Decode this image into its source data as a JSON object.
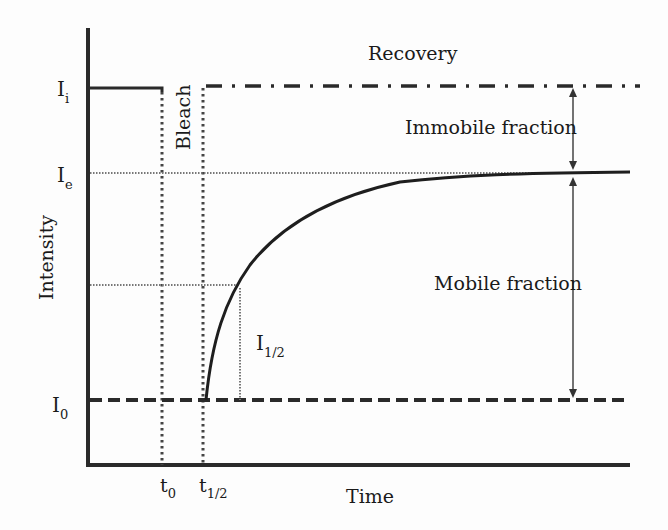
{
  "figure": {
    "type": "FRAP recovery curve diagram",
    "axes": {
      "xlabel": "Time",
      "ylabel": "Intensity",
      "x_ticks": [
        {
          "base": "t",
          "sub": "0"
        },
        {
          "base": "t",
          "sub": "1/2"
        }
      ],
      "y_ticks": [
        {
          "base": "I",
          "sub": "i"
        },
        {
          "base": "I",
          "sub": "e"
        },
        {
          "base": "I",
          "sub": "0"
        }
      ]
    },
    "labels": {
      "bleach": "Bleach",
      "recovery": "Recovery",
      "immobile_fraction": "Immobile fraction",
      "mobile_fraction": "Mobile fraction",
      "half_intensity": {
        "base": "I",
        "sub": "1/2"
      }
    },
    "colors": {
      "line": "#2a2a2a",
      "dotted": "#555555",
      "background": "#fdfdfd"
    }
  }
}
